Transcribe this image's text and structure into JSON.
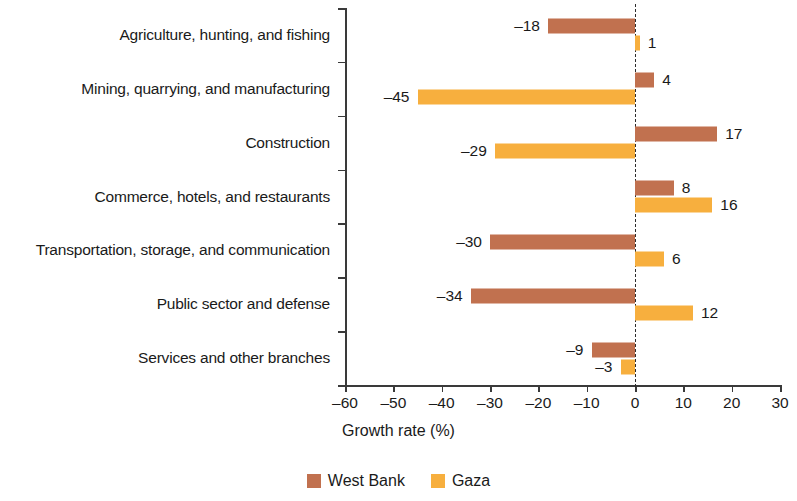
{
  "chart_data": {
    "type": "bar",
    "orientation": "horizontal",
    "title": "",
    "xlabel": "Growth rate (%)",
    "ylabel": "",
    "xlim": [
      -60,
      30
    ],
    "xticks": [
      -60,
      -50,
      -40,
      -30,
      -20,
      -10,
      0,
      10,
      20,
      30
    ],
    "xtick_labels": [
      "–60",
      "–50",
      "–40",
      "–30",
      "–20",
      "–10",
      "0",
      "10",
      "20",
      "30"
    ],
    "grid": false,
    "zero_reference_line": true,
    "legend_position": "bottom-center",
    "categories": [
      "Agriculture, hunting, and fishing",
      "Mining, quarrying, and manufacturing",
      "Construction",
      "Commerce, hotels, and restaurants",
      "Transportation, storage, and communication",
      "Public sector and defense",
      "Services and other branches"
    ],
    "series": [
      {
        "name": "West Bank",
        "color": "#c1714f",
        "values": [
          -18,
          4,
          17,
          8,
          -30,
          -34,
          -9
        ],
        "data_labels": [
          "–18",
          "4",
          "17",
          "8",
          "–30",
          "–34",
          "–9"
        ]
      },
      {
        "name": "Gaza",
        "color": "#f7af3e",
        "values": [
          1,
          -45,
          -29,
          16,
          6,
          12,
          -3
        ],
        "data_labels": [
          "1",
          "–45",
          "–29",
          "16",
          "6",
          "12",
          "–3"
        ]
      }
    ]
  }
}
